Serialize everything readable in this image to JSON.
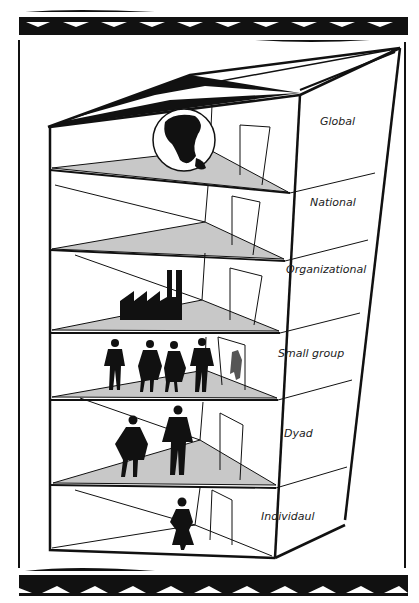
{
  "diagram": {
    "type": "building-levels",
    "levels": [
      {
        "label": "Global",
        "icon": "globe-icon"
      },
      {
        "label": "National",
        "icon": ""
      },
      {
        "label": "Organizational",
        "icon": "factory-icon"
      },
      {
        "label": "Small group",
        "icon": "group-of-people-icon"
      },
      {
        "label": "Dyad",
        "icon": "two-people-icon"
      },
      {
        "label": "Individaul",
        "icon": "person-icon"
      }
    ],
    "colors": {
      "ink": "#111111",
      "floor": "#c8c8c8",
      "background": "#ffffff"
    }
  }
}
